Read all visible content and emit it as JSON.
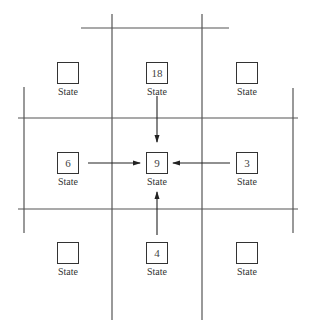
{
  "diagram": {
    "title": "",
    "state_label": "State",
    "cells": [
      {
        "id": "nw",
        "row": 0,
        "col": 0,
        "value": "",
        "label": "State"
      },
      {
        "id": "n",
        "row": 0,
        "col": 1,
        "value": "18",
        "label": "State"
      },
      {
        "id": "ne",
        "row": 0,
        "col": 2,
        "value": "",
        "label": "State"
      },
      {
        "id": "w",
        "row": 1,
        "col": 0,
        "value": "6",
        "label": "State"
      },
      {
        "id": "c",
        "row": 1,
        "col": 1,
        "value": "9",
        "label": "State"
      },
      {
        "id": "e",
        "row": 1,
        "col": 2,
        "value": "3",
        "label": "State"
      },
      {
        "id": "sw",
        "row": 2,
        "col": 0,
        "value": "",
        "label": "State"
      },
      {
        "id": "s",
        "row": 2,
        "col": 1,
        "value": "4",
        "label": "State"
      },
      {
        "id": "se",
        "row": 2,
        "col": 2,
        "value": "",
        "label": "State"
      }
    ],
    "arrows": [
      {
        "from": "n",
        "to": "c"
      },
      {
        "from": "w",
        "to": "c"
      },
      {
        "from": "e",
        "to": "c"
      },
      {
        "from": "s",
        "to": "c"
      }
    ],
    "line_color": "#444444"
  }
}
